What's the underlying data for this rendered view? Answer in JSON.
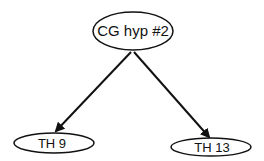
{
  "diagram": {
    "type": "tree",
    "nodes": [
      {
        "id": "root",
        "label": "CG hyp #2",
        "cx": 133,
        "cy": 31,
        "rx": 40,
        "ry": 19,
        "font_size": 15
      },
      {
        "id": "left",
        "label": "TH 9",
        "cx": 54,
        "cy": 143,
        "rx": 40,
        "ry": 10,
        "font_size": 13
      },
      {
        "id": "right",
        "label": "TH 13",
        "cx": 211,
        "cy": 147,
        "rx": 40,
        "ry": 9,
        "font_size": 13
      }
    ],
    "edges": [
      {
        "from": "root",
        "to": "left",
        "x1": 131,
        "y1": 52,
        "x2": 56,
        "y2": 131
      },
      {
        "from": "root",
        "to": "right",
        "x1": 134,
        "y1": 52,
        "x2": 209,
        "y2": 137
      }
    ],
    "colors": {
      "stroke": "#111111",
      "background": "#ffffff"
    }
  }
}
